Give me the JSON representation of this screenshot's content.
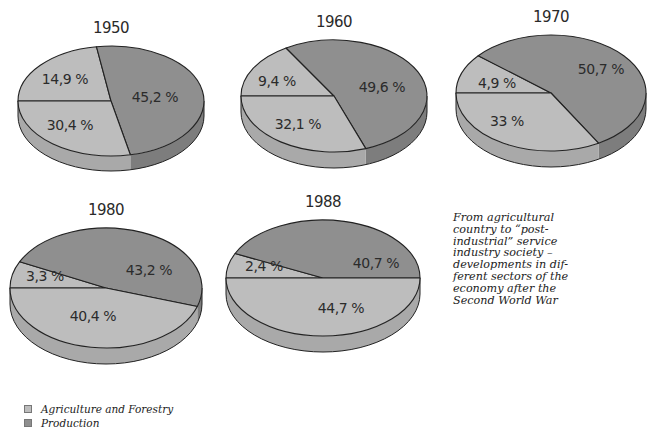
{
  "colors": {
    "agriculture": "#bdbdbd",
    "production": "#8f8f8f",
    "services": "#bdbdbd",
    "side_light": "#a9a9a9",
    "side_dark": "#7d7d7d",
    "outline": "#222222"
  },
  "caption": {
    "lines": [
      "From agricultural",
      "country to “post-",
      "industrial” service",
      "industry society –",
      "developments in dif-",
      "ferent sectors of the",
      "economy after the",
      "Second World War"
    ]
  },
  "legend": {
    "items": [
      {
        "label": "Agriculture and Forestry",
        "color": "#bdbdbd"
      },
      {
        "label": "Production",
        "color": "#8f8f8f"
      }
    ]
  },
  "chart_data": {
    "type": "pie",
    "legend_position": "bottom-left",
    "series_names": [
      "Agriculture and Forestry",
      "Production",
      "(unlabeled third sector)"
    ],
    "charts": [
      {
        "year": "1950",
        "labels": [
          "14,9 %",
          "45,2 %",
          "30,4 %"
        ],
        "values": [
          14.9,
          45.2,
          30.4
        ],
        "geom": {
          "cx": 111,
          "cy": 101,
          "rx": 93,
          "ry": 55,
          "depth": 15,
          "angles": [
            -180,
            -99,
            78
          ]
        }
      },
      {
        "year": "1960",
        "labels": [
          "9,4 %",
          "49,6 %",
          "32,1 %"
        ],
        "values": [
          9.4,
          49.6,
          32.1
        ],
        "geom": {
          "cx": 334,
          "cy": 96,
          "rx": 93,
          "ry": 56,
          "depth": 16,
          "angles": [
            -180,
            -121,
            70
          ]
        }
      },
      {
        "year": "1970",
        "labels": [
          "4,9 %",
          "50,7 %",
          "33 %"
        ],
        "values": [
          4.9,
          50.7,
          33
        ],
        "geom": {
          "cx": 551,
          "cy": 93,
          "rx": 95,
          "ry": 58,
          "depth": 16,
          "angles": [
            -180,
            -140,
            60
          ]
        }
      },
      {
        "year": "1980",
        "labels": [
          "3,3 %",
          "43,2 %",
          "40,4 %"
        ],
        "values": [
          3.3,
          43.2,
          40.4
        ],
        "geom": {
          "cx": 106,
          "cy": 288,
          "rx": 96,
          "ry": 60,
          "depth": 16,
          "angles": [
            -180,
            -154,
            18
          ]
        }
      },
      {
        "year": "1988",
        "labels": [
          "2,4 %",
          "40,7 %",
          "44,7 %"
        ],
        "values": [
          2.4,
          40.7,
          44.7
        ],
        "geom": {
          "cx": 323,
          "cy": 278,
          "rx": 97,
          "ry": 58,
          "depth": 16,
          "angles": [
            -180,
            -155,
            0
          ]
        }
      }
    ]
  }
}
